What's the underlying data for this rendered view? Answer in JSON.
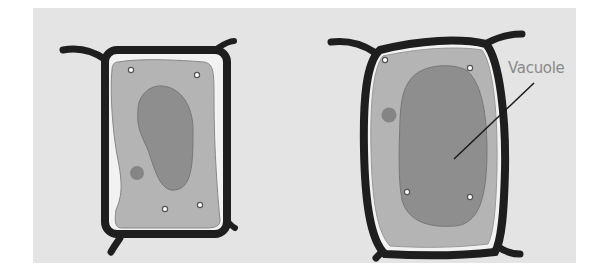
{
  "figure": {
    "colors": {
      "background": "#e4e4e4",
      "cell_wall": "#1e1e1e",
      "cytoplasm": "#b4b4b4",
      "vacuole": "#8e8e8e",
      "nucleus": "#858585",
      "label_text": "#8a8a8a"
    },
    "cells": [
      {
        "name": "left-cell",
        "state": "shrunken"
      },
      {
        "name": "right-cell",
        "state": "turgid"
      }
    ],
    "labels": {
      "vacuole": "Vacuole"
    }
  }
}
